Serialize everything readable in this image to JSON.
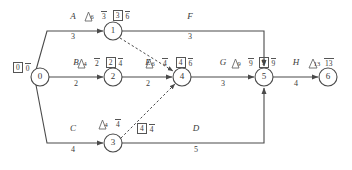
{
  "diagram": {
    "type": "activity-on-arrow-network",
    "title": "",
    "nodes": [
      {
        "id": "0",
        "label": "0",
        "x": 40,
        "y": 77,
        "r": 9
      },
      {
        "id": "1",
        "label": "1",
        "x": 113,
        "y": 31,
        "r": 9
      },
      {
        "id": "2",
        "label": "2",
        "x": 113,
        "y": 77,
        "r": 9
      },
      {
        "id": "3",
        "label": "3",
        "x": 113,
        "y": 143,
        "r": 9
      },
      {
        "id": "4",
        "label": "4",
        "x": 182,
        "y": 77,
        "r": 9
      },
      {
        "id": "5",
        "label": "5",
        "x": 264,
        "y": 77,
        "r": 9
      },
      {
        "id": "6",
        "label": "6",
        "x": 328,
        "y": 77,
        "r": 9
      }
    ],
    "activities": [
      {
        "name": "A",
        "duration": "3",
        "from": "0",
        "to": "1",
        "name_x": 73,
        "name_y": 22,
        "dur_x": 73,
        "dur_y": 33
      },
      {
        "name": "B",
        "duration": "2",
        "from": "0",
        "to": "2",
        "name_x": 76,
        "name_y": 68,
        "dur_x": 76,
        "dur_y": 80
      },
      {
        "name": "C",
        "duration": "4",
        "from": "0",
        "to": "3",
        "name_x": 73,
        "name_y": 134,
        "dur_x": 73,
        "dur_y": 146
      },
      {
        "name": "F",
        "duration": "3",
        "from": "1",
        "to": "5",
        "name_x": 190,
        "name_y": 22,
        "dur_x": 190,
        "dur_y": 33
      },
      {
        "name": "E",
        "duration": "2",
        "from": "2",
        "to": "4",
        "name_x": 148,
        "name_y": 68,
        "dur_x": 148,
        "dur_y": 80
      },
      {
        "name": "D",
        "duration": "5",
        "from": "3",
        "to": "5",
        "name_x": 196,
        "name_y": 134,
        "dur_x": 196,
        "dur_y": 146
      },
      {
        "name": "G",
        "duration": "3",
        "from": "4",
        "to": "5",
        "name_x": 223,
        "name_y": 68,
        "dur_x": 223,
        "dur_y": 80
      },
      {
        "name": "H",
        "duration": "4",
        "from": "5",
        "to": "6",
        "name_x": 296,
        "name_y": 68,
        "dur_x": 296,
        "dur_y": 80
      }
    ],
    "dummies": [
      {
        "from": "1",
        "to": "4"
      },
      {
        "from": "3",
        "to": "4"
      }
    ],
    "annotations": [
      {
        "node": "0",
        "x": 13,
        "y": 62,
        "triangle": "",
        "plain": "0",
        "boxed": "0",
        "bar": "0",
        "style": "box-bar"
      },
      {
        "node": "1",
        "x": 85,
        "y": 10,
        "triangle": "6",
        "bar": "3",
        "boxed": "3",
        "bar2": "6",
        "style": "tri-bar-box-bar"
      },
      {
        "node": "2",
        "x": 78,
        "y": 57,
        "triangle": "4",
        "bar": "2",
        "boxed": "2",
        "bar2": "4",
        "style": "tri-bar-box-bar"
      },
      {
        "node": "4",
        "x": 146,
        "y": 57,
        "triangle": "6",
        "bar": "4",
        "boxed": "4",
        "bar2": "6",
        "style": "tri-bar-box-bar"
      },
      {
        "node": "5",
        "x": 232,
        "y": 57,
        "triangle": "9",
        "bar": "9",
        "boxed": "9",
        "bar2": "9",
        "style": "tri-bar-box-bar"
      },
      {
        "node": "6",
        "x": 309,
        "y": 57,
        "triangle": "13",
        "bar": "13",
        "style": "tri-bar"
      },
      {
        "node": "3",
        "x": 99,
        "y": 118,
        "triangle": "4",
        "bar": "4",
        "style": "tri-bar"
      },
      {
        "node": "3b",
        "x": 137,
        "y": 123,
        "boxed": "4",
        "bar2": "4",
        "style": "box-bar"
      }
    ],
    "colors": {
      "stroke": "#4a4a4a",
      "text": "#3a3a3a",
      "background": "#ffffff"
    }
  }
}
